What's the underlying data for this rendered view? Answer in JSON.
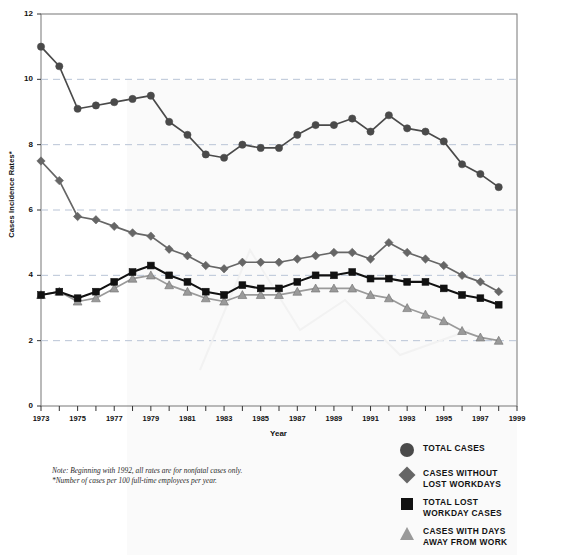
{
  "chart_data": {
    "type": "line",
    "title": "",
    "xlabel": "Year",
    "ylabel": "Cases Incidence Rates*",
    "xlim": [
      1973,
      1999
    ],
    "ylim": [
      0,
      12
    ],
    "yticks": [
      0,
      2,
      4,
      6,
      8,
      10,
      12
    ],
    "xticks": [
      1973,
      1975,
      1977,
      1979,
      1981,
      1983,
      1985,
      1987,
      1989,
      1991,
      1993,
      1995,
      1997,
      1999
    ],
    "grid": "horizontal-dashed",
    "legend_position": "bottom-right",
    "x": [
      1973,
      1974,
      1975,
      1976,
      1977,
      1978,
      1979,
      1980,
      1981,
      1982,
      1983,
      1984,
      1985,
      1986,
      1987,
      1988,
      1989,
      1990,
      1991,
      1992,
      1993,
      1994,
      1995,
      1996,
      1997,
      1998
    ],
    "series": [
      {
        "name": "TOTAL CASES",
        "marker": "circle",
        "color": "#4a4a4a",
        "values": [
          11.0,
          10.4,
          9.1,
          9.2,
          9.3,
          9.4,
          9.5,
          8.7,
          8.3,
          7.7,
          7.6,
          8.0,
          7.9,
          7.9,
          8.3,
          8.6,
          8.6,
          8.8,
          8.4,
          8.9,
          8.5,
          8.4,
          8.1,
          7.4,
          7.1,
          6.7
        ]
      },
      {
        "name": "CASES WITHOUT\nLOST WORKDAYS",
        "marker": "diamond",
        "color": "#666666",
        "values": [
          7.5,
          6.9,
          5.8,
          5.7,
          5.5,
          5.3,
          5.2,
          4.8,
          4.6,
          4.3,
          4.2,
          4.4,
          4.4,
          4.4,
          4.5,
          4.6,
          4.7,
          4.7,
          4.5,
          5.0,
          4.7,
          4.5,
          4.3,
          4.0,
          3.8,
          3.5
        ]
      },
      {
        "name": "TOTAL LOST\nWORKDAY CASES",
        "marker": "square",
        "color": "#111111",
        "values": [
          3.4,
          3.5,
          3.3,
          3.5,
          3.8,
          4.1,
          4.3,
          4.0,
          3.8,
          3.5,
          3.4,
          3.7,
          3.6,
          3.6,
          3.8,
          4.0,
          4.0,
          4.1,
          3.9,
          3.9,
          3.8,
          3.8,
          3.6,
          3.4,
          3.3,
          3.1
        ]
      },
      {
        "name": "CASES WITH DAYS\nAWAY FROM WORK",
        "marker": "triangle",
        "color": "#9a9a9a",
        "values": [
          3.4,
          3.5,
          3.2,
          3.3,
          3.6,
          3.9,
          4.0,
          3.7,
          3.5,
          3.3,
          3.2,
          3.4,
          3.4,
          3.4,
          3.5,
          3.6,
          3.6,
          3.6,
          3.4,
          3.3,
          3.0,
          2.8,
          2.6,
          2.3,
          2.1,
          2.0
        ]
      }
    ]
  },
  "axis": {
    "y_ticks": [
      "0",
      "2",
      "4",
      "6",
      "8",
      "10",
      "12"
    ],
    "x_ticks": [
      "1973",
      "1975",
      "1977",
      "1979",
      "1981",
      "1983",
      "1985",
      "1987",
      "1989",
      "1991",
      "1993",
      "1995",
      "1997",
      "1999"
    ],
    "y_title": "Cases Incidence Rates*",
    "x_title": "Year"
  },
  "legend": {
    "items": [
      {
        "label": "TOTAL CASES",
        "marker": "circle",
        "color": "#4a4a4a"
      },
      {
        "label": "CASES WITHOUT\nLOST WORKDAYS",
        "marker": "diamond",
        "color": "#666666"
      },
      {
        "label": "TOTAL LOST\nWORKDAY CASES",
        "marker": "square",
        "color": "#111111"
      },
      {
        "label": "CASES WITH DAYS\nAWAY FROM WORK",
        "marker": "triangle",
        "color": "#9a9a9a"
      }
    ]
  },
  "notes": {
    "line1": "Note: Beginning with 1992, all rates are for nonfatal cases only.",
    "line2": "*Number of cases per 100 full-time employees per year."
  }
}
